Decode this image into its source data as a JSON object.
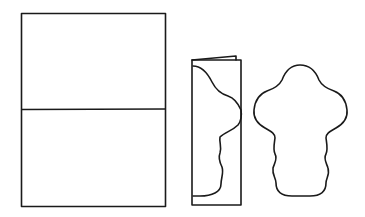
{
  "diagram": {
    "colors": {
      "stroke": "#1a1a1a",
      "background": "#ffffff"
    },
    "steps": [
      {
        "id": "sheet",
        "label": ""
      },
      {
        "id": "folded-strip",
        "label": ""
      },
      {
        "id": "cutout-shape",
        "label": ""
      }
    ]
  }
}
